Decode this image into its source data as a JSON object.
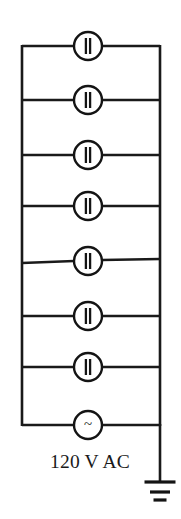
{
  "figure": {
    "background_color": "#ffffff",
    "line_color": "#1a1a1a",
    "width": 181,
    "height": 519
  },
  "source": {
    "label": "120 V AC",
    "symbol": "~",
    "symbol_name": "ac-source-icon",
    "center_x": 88,
    "center_y": 425,
    "radius": 14,
    "label_x": 90,
    "label_y": 468
  },
  "rails": {
    "left_x": 22,
    "right_x": 160,
    "top_y": 46,
    "bottom_y": 425,
    "stroke_width": 2.6
  },
  "ground": {
    "name": "earth-ground-icon",
    "stem_x": 160,
    "stem_top_y": 425,
    "stem_bottom_y": 481,
    "bars": [
      {
        "y": 482,
        "half_width": 15.5,
        "thickness": 3.2
      },
      {
        "y": 492,
        "half_width": 10.0,
        "thickness": 3.2
      },
      {
        "y": 500,
        "half_width": 6.5,
        "thickness": 3.2
      }
    ]
  },
  "branches": [
    {
      "index": 1,
      "name": "capacitor-branch-1",
      "y_left": 46,
      "y_right": 46,
      "center_x": 88,
      "center_y": 46,
      "radius": 14,
      "component": "capacitor",
      "symbol": "capacitor-icon"
    },
    {
      "index": 2,
      "name": "capacitor-branch-2",
      "y_left": 100,
      "y_right": 100,
      "center_x": 88,
      "center_y": 100,
      "radius": 14,
      "component": "capacitor",
      "symbol": "capacitor-icon"
    },
    {
      "index": 3,
      "name": "capacitor-branch-3",
      "y_left": 155,
      "y_right": 155,
      "center_x": 88,
      "center_y": 155,
      "radius": 14,
      "component": "capacitor",
      "symbol": "capacitor-icon"
    },
    {
      "index": 4,
      "name": "capacitor-branch-4",
      "y_left": 206,
      "y_right": 206,
      "center_x": 88,
      "center_y": 206,
      "radius": 14,
      "component": "capacitor",
      "symbol": "capacitor-icon"
    },
    {
      "index": 5,
      "name": "capacitor-branch-5",
      "y_left": 263,
      "y_right": 259,
      "center_x": 88,
      "center_y": 261,
      "radius": 14,
      "component": "capacitor",
      "symbol": "capacitor-icon"
    },
    {
      "index": 6,
      "name": "capacitor-branch-6",
      "y_left": 316,
      "y_right": 316,
      "center_x": 88,
      "center_y": 316,
      "radius": 14,
      "component": "capacitor",
      "symbol": "capacitor-icon"
    },
    {
      "index": 7,
      "name": "capacitor-branch-7",
      "y_left": 367,
      "y_right": 367,
      "center_x": 88,
      "center_y": 367,
      "radius": 14,
      "component": "capacitor",
      "symbol": "capacitor-icon"
    },
    {
      "index": 8,
      "name": "ac-source-branch",
      "y_left": 425,
      "y_right": 425,
      "center_x": 88,
      "center_y": 425,
      "radius": 14,
      "component": "ac_source",
      "symbol": "ac-source-icon"
    }
  ],
  "capacitor_plates": {
    "gap": 4.2,
    "half_height": 8.0,
    "thickness": 2.3
  }
}
